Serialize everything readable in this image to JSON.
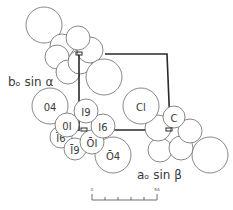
{
  "figure": {
    "type": "crystal-structure-projection",
    "axis_labels": {
      "b_axis": "bₒ sin α",
      "a_axis": "aₒ sin β"
    },
    "atom_labels": {
      "o4": "04",
      "i9": "I9",
      "i6": "I6",
      "o1": "0I",
      "i6_bar": "Ī6",
      "i9_bar": "Ī9",
      "o1_bar": "ŌI",
      "o4_bar": "Ō4",
      "cl": "Cl",
      "c": "C"
    },
    "scale_bar": {
      "start_label": "0",
      "end_label": "5A"
    }
  }
}
